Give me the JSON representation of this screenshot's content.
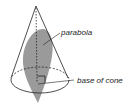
{
  "diagram": {
    "labels": {
      "parabola": "parabola",
      "base": "base of cone"
    },
    "colors": {
      "outline": "#222222",
      "section_fill": "#9a9a9a",
      "background": "#ffffff"
    }
  }
}
